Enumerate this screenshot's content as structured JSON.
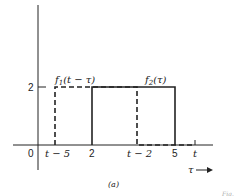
{
  "diagram": {
    "caption": "(a)",
    "axis": {
      "x_label": "τ",
      "y_tick": "2",
      "origin": "0",
      "x_ticks": [
        "t − 5",
        "2",
        "t − 2",
        "5",
        "t"
      ]
    },
    "curves": [
      {
        "name": "f1",
        "label_base": "f",
        "label_sub": "1",
        "label_arg": "(t − τ)",
        "style": "dashed",
        "height": 2,
        "from": "t − 5",
        "to": "t − 2"
      },
      {
        "name": "f2",
        "label_base": "f",
        "label_sub": "2",
        "label_arg": "(τ)",
        "style": "solid",
        "height": 2,
        "from": "2",
        "to": "5"
      }
    ],
    "footer_fragment": "Fig."
  },
  "colors": {
    "ink": "#222222",
    "background": "#ffffff"
  }
}
